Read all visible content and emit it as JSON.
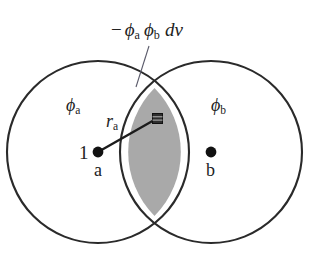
{
  "figure": {
    "type": "overlap-integral-diagram",
    "background_color": "#ffffff",
    "stroke_color": "#2a2a2a",
    "overlap_fill_color": "#a9a9a9"
  },
  "labels": {
    "dv_expression": {
      "minus": "−",
      "phi": "ϕ",
      "sub_a": "a",
      "sub_b": "b",
      "dv": "dv",
      "full_text": "− ϕa ϕb dv"
    },
    "phi_a": {
      "symbol": "ϕ",
      "subscript": "a",
      "full_text": "ϕa"
    },
    "phi_b": {
      "symbol": "ϕ",
      "subscript": "b",
      "full_text": "ϕb"
    },
    "r_a": {
      "symbol": "r",
      "subscript": "a",
      "full_text": "ra"
    },
    "electron_index": "1",
    "nucleus_a": "a",
    "nucleus_b": "b"
  },
  "geometry": {
    "circle_a": {
      "cx": 98,
      "cy": 152,
      "r": 91
    },
    "circle_b": {
      "cx": 211,
      "cy": 152,
      "r": 91
    },
    "nucleus_a_dot": {
      "cx": 98,
      "cy": 152,
      "r": 5
    },
    "nucleus_b_dot": {
      "cx": 211,
      "cy": 152,
      "r": 5
    },
    "volume_element_square": {
      "x": 152,
      "y": 113,
      "size": 10
    },
    "radius_line": {
      "x1": 98,
      "y1": 152,
      "x2": 155,
      "y2": 119
    },
    "leader_line": {
      "x1": 148,
      "y1": 45,
      "x2": 135,
      "y2": 87
    },
    "intersection_top": {
      "x": 154,
      "y": 88
    },
    "intersection_bottom": {
      "x": 154,
      "y": 216
    }
  }
}
